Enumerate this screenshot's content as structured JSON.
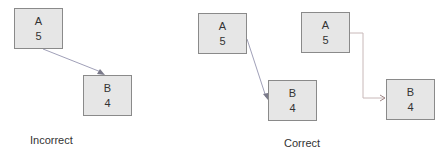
{
  "diagrams": [
    {
      "caption": "Incorrect",
      "nodes": [
        {
          "id": "A",
          "label": "A",
          "value": "5"
        },
        {
          "id": "B",
          "label": "B",
          "value": "4"
        }
      ],
      "edge": {
        "from": "A",
        "to": "B",
        "style": "diagonal line, arrow ends on top edge of B"
      }
    },
    {
      "caption": "Correct",
      "nodes": [
        {
          "id": "A",
          "label": "A",
          "value": "5"
        },
        {
          "id": "B",
          "label": "B",
          "value": "4"
        }
      ],
      "edge": {
        "from": "A",
        "to": "B",
        "style": "diagonal line from right edge of A to left edge of B"
      }
    },
    {
      "caption": "",
      "nodes": [
        {
          "id": "A",
          "label": "A",
          "value": "5"
        },
        {
          "id": "B",
          "label": "B",
          "value": "4"
        }
      ],
      "edge": {
        "from": "A",
        "to": "B",
        "style": "orthogonal elbow line from right edge of A to left edge of B"
      }
    }
  ],
  "colors": {
    "node_fill": "#e6e6e6",
    "node_border": "#8a8a8a",
    "edge_diagonal": "#a0a0b8",
    "edge_elbow": "#c8b8b8",
    "arrow_head": "#7a7a8a"
  }
}
